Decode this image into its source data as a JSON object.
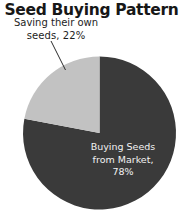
{
  "chart_data": {
    "type": "pie",
    "title": "Seed Buying Pattern",
    "xlabel": "",
    "ylabel": "",
    "grid": false,
    "legend": "none",
    "start_angle_deg": 90,
    "direction": "clockwise",
    "categories": [
      "Buying Seeds from Market",
      "Saving their own seeds"
    ],
    "values": [
      78,
      22
    ],
    "units": "percent",
    "colors": [
      "#3a3a3a",
      "#c2c2c2"
    ],
    "slices": [
      {
        "name": "Buying Seeds from Market",
        "value": 78,
        "color": "#3a3a3a",
        "label_placement": "inside",
        "label_color": "#f2f2f2",
        "label_lines": [
          "Buying Seeds",
          "from Market,",
          "78%"
        ]
      },
      {
        "name": "Saving their own seeds",
        "value": 22,
        "color": "#c2c2c2",
        "label_placement": "outside",
        "label_color": "#1d1d1d",
        "leader_line": true,
        "label_lines": [
          "Saving their own",
          "seeds, 22%"
        ]
      }
    ]
  },
  "chart": {
    "title": "Seed Buying Pattern",
    "left_label": {
      "line1": "Saving their own",
      "line2": "seeds, 22%"
    },
    "right_label": {
      "line1": "Buying Seeds",
      "line2": "from Market,",
      "line3": "78%"
    }
  }
}
